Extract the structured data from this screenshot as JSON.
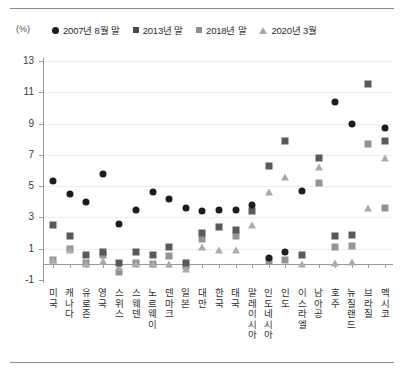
{
  "figure": {
    "unit_label": "(%)",
    "top_rule": true,
    "bottom_rule": true
  },
  "legend": {
    "position": "top",
    "entries": [
      {
        "label": "2007년 8월 말",
        "marker": "circle",
        "color": "#1c1c1c"
      },
      {
        "label": "2013년 말",
        "marker": "square-dark",
        "color": "#4a4a4a"
      },
      {
        "label": "2018년 말",
        "marker": "square-light",
        "color": "#8e8e8e"
      },
      {
        "label": "2020년 3월",
        "marker": "triangle",
        "color": "#a8a8a8"
      }
    ]
  },
  "chart_data": {
    "type": "scatter",
    "title": "",
    "xlabel": "",
    "ylabel": "(%)",
    "ylim": [
      -1,
      13
    ],
    "yticks": [
      -1,
      1,
      3,
      5,
      7,
      9,
      11,
      13
    ],
    "grid": true,
    "legend_position": "top",
    "categories": [
      "미국",
      "캐나다",
      "유로존",
      "영국",
      "스위스",
      "스웨덴",
      "노르웨이",
      "덴마크",
      "일본",
      "대만",
      "한국",
      "태국",
      "말레이시아",
      "인도네시아",
      "인도",
      "이스라엘",
      "남아공",
      "호주",
      "뉴질랜드",
      "브라질",
      "멕시코"
    ],
    "series": [
      {
        "name": "2007년 8월 말",
        "marker": "circle",
        "values": [
          5.3,
          4.5,
          4.0,
          5.8,
          2.6,
          3.5,
          4.6,
          4.2,
          3.6,
          3.4,
          3.5,
          3.5,
          3.8,
          0.4,
          0.8,
          4.7,
          null,
          10.4,
          9.0,
          null,
          8.7
        ]
      },
      {
        "name": "2013년 말",
        "marker": "square-dark",
        "values": [
          2.5,
          1.8,
          0.6,
          0.8,
          0.1,
          0.8,
          0.6,
          1.1,
          0.1,
          2.0,
          2.4,
          2.2,
          3.4,
          6.3,
          7.9,
          0.6,
          6.8,
          1.8,
          1.9,
          11.5,
          7.9
        ]
      },
      {
        "name": "2018년 말",
        "marker": "square-light",
        "values": [
          0.3,
          1.0,
          0.1,
          0.6,
          -0.5,
          0.1,
          0.05,
          0.55,
          -0.1,
          1.6,
          null,
          1.8,
          null,
          0.2,
          0.3,
          null,
          5.2,
          1.1,
          1.2,
          7.7,
          3.6
        ]
      },
      {
        "name": "2020년 3월",
        "marker": "triangle",
        "values": [
          0.3,
          0.9,
          0.0,
          0.2,
          -0.2,
          0.0,
          0.05,
          0.0,
          -0.3,
          1.1,
          0.9,
          0.9,
          2.5,
          4.6,
          5.6,
          0.05,
          6.2,
          0.1,
          0.15,
          3.6,
          6.8
        ]
      }
    ]
  }
}
